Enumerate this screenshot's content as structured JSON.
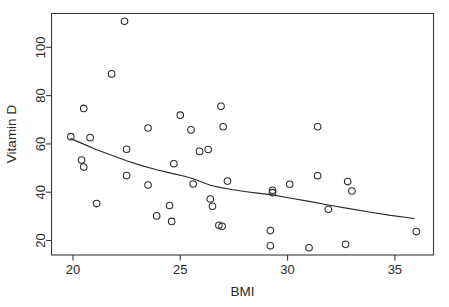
{
  "chart_data": {
    "type": "scatter",
    "title": "",
    "xlabel": "BMI",
    "ylabel": "Vitamin D",
    "xlim": [
      19.0,
      36.8
    ],
    "ylim": [
      14.0,
      114.0
    ],
    "xticks": [
      20,
      25,
      30,
      35
    ],
    "yticks": [
      20,
      40,
      60,
      80,
      100
    ],
    "xtick_labels": [
      "20",
      "25",
      "30",
      "35"
    ],
    "ytick_labels": [
      "20",
      "40",
      "60",
      "80",
      "100"
    ],
    "grid": false,
    "legend": null,
    "marker": "open-circle",
    "points": [
      {
        "x": 19.9,
        "y": 63.0
      },
      {
        "x": 20.5,
        "y": 74.7
      },
      {
        "x": 20.4,
        "y": 53.3
      },
      {
        "x": 20.5,
        "y": 50.4
      },
      {
        "x": 20.8,
        "y": 62.6
      },
      {
        "x": 21.1,
        "y": 35.3
      },
      {
        "x": 21.8,
        "y": 89.0
      },
      {
        "x": 22.4,
        "y": 110.8
      },
      {
        "x": 22.5,
        "y": 57.8
      },
      {
        "x": 22.5,
        "y": 46.9
      },
      {
        "x": 23.5,
        "y": 66.6
      },
      {
        "x": 23.5,
        "y": 43.0
      },
      {
        "x": 23.9,
        "y": 30.2
      },
      {
        "x": 24.5,
        "y": 34.5
      },
      {
        "x": 24.6,
        "y": 27.9
      },
      {
        "x": 24.7,
        "y": 51.8
      },
      {
        "x": 25.0,
        "y": 71.9
      },
      {
        "x": 25.5,
        "y": 65.8
      },
      {
        "x": 25.6,
        "y": 43.4
      },
      {
        "x": 25.9,
        "y": 56.9
      },
      {
        "x": 26.3,
        "y": 57.7
      },
      {
        "x": 26.4,
        "y": 37.2
      },
      {
        "x": 26.5,
        "y": 34.2
      },
      {
        "x": 26.8,
        "y": 26.3
      },
      {
        "x": 26.95,
        "y": 25.9
      },
      {
        "x": 26.9,
        "y": 75.6
      },
      {
        "x": 27.0,
        "y": 67.1
      },
      {
        "x": 27.2,
        "y": 44.6
      },
      {
        "x": 29.2,
        "y": 24.1
      },
      {
        "x": 29.2,
        "y": 17.8
      },
      {
        "x": 29.3,
        "y": 40.8
      },
      {
        "x": 29.3,
        "y": 39.8
      },
      {
        "x": 30.1,
        "y": 43.3
      },
      {
        "x": 31.0,
        "y": 17.0
      },
      {
        "x": 31.4,
        "y": 67.1
      },
      {
        "x": 31.4,
        "y": 46.8
      },
      {
        "x": 31.9,
        "y": 32.9
      },
      {
        "x": 32.7,
        "y": 18.4
      },
      {
        "x": 32.8,
        "y": 44.4
      },
      {
        "x": 33.0,
        "y": 40.5
      },
      {
        "x": 36.0,
        "y": 23.7
      }
    ],
    "trend_line": {
      "name": "lowess-smoother",
      "points": [
        {
          "x": 19.9,
          "y": 62.2
        },
        {
          "x": 20.5,
          "y": 59.9
        },
        {
          "x": 21.1,
          "y": 57.6
        },
        {
          "x": 21.8,
          "y": 55.3
        },
        {
          "x": 22.5,
          "y": 53.0
        },
        {
          "x": 23.2,
          "y": 51.0
        },
        {
          "x": 23.9,
          "y": 49.3
        },
        {
          "x": 24.6,
          "y": 47.8
        },
        {
          "x": 25.2,
          "y": 46.6
        },
        {
          "x": 25.6,
          "y": 45.6
        },
        {
          "x": 26.0,
          "y": 44.2
        },
        {
          "x": 26.4,
          "y": 42.9
        },
        {
          "x": 26.9,
          "y": 41.9
        },
        {
          "x": 27.4,
          "y": 41.1
        },
        {
          "x": 28.0,
          "y": 40.3
        },
        {
          "x": 28.6,
          "y": 39.6
        },
        {
          "x": 29.3,
          "y": 38.9
        },
        {
          "x": 30.1,
          "y": 37.6
        },
        {
          "x": 31.0,
          "y": 36.2
        },
        {
          "x": 31.9,
          "y": 34.7
        },
        {
          "x": 32.8,
          "y": 33.3
        },
        {
          "x": 33.8,
          "y": 31.8
        },
        {
          "x": 34.8,
          "y": 30.4
        },
        {
          "x": 35.9,
          "y": 29.1
        }
      ]
    },
    "colors": {
      "marker_stroke": "#2b2b2b",
      "line_stroke": "#2b2b2b",
      "frame": "#3a3a3a",
      "background": "#ffffff",
      "text": "#2b2b2b"
    }
  }
}
